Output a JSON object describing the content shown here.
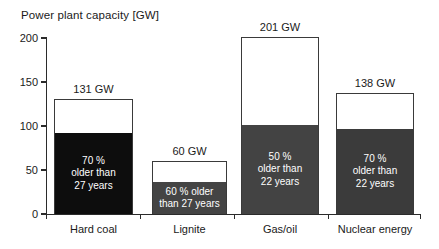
{
  "chart_data": {
    "type": "bar",
    "title": "Power plant capacity [GW]",
    "xlabel": "",
    "ylabel": "",
    "ylim": [
      0,
      200
    ],
    "yticks": [
      0,
      50,
      100,
      150,
      200
    ],
    "grid": false,
    "legend": "none",
    "unit": "GW",
    "categories": [
      "Hard coal",
      "Lignite",
      "Gas/oil",
      "Nuclear energy"
    ],
    "values": [
      131,
      60,
      201,
      138
    ],
    "value_labels": [
      "131 GW",
      "60 GW",
      "201 GW",
      "138 GW"
    ],
    "series": [
      {
        "name": "Total capacity",
        "values": [
          131,
          60,
          201,
          138
        ]
      },
      {
        "name": "Aged capacity (older than threshold)",
        "values": [
          92,
          36,
          101,
          97
        ],
        "share_percent": [
          70,
          60,
          50,
          70
        ],
        "age_years": [
          27,
          27,
          22,
          22
        ]
      }
    ],
    "bars": [
      {
        "category": "Hard coal",
        "total": 131,
        "total_label": "131 GW",
        "aged_value": 92,
        "aged_share_percent": 70,
        "aged_age_years": 27,
        "inner_label_lines": [
          "70 %",
          "older than",
          "27 years"
        ],
        "fill_color": "#0d0d0d",
        "outline_color": "#3a3a3a"
      },
      {
        "category": "Lignite",
        "total": 60,
        "total_label": "60 GW",
        "aged_value": 36,
        "aged_share_percent": 60,
        "aged_age_years": 27,
        "inner_label_lines": [
          "60 % older",
          "than 27 years"
        ],
        "fill_color": "#444444",
        "outline_color": "#3a3a3a"
      },
      {
        "category": "Gas/oil",
        "total": 201,
        "total_label": "201 GW",
        "aged_value": 101,
        "aged_share_percent": 50,
        "aged_age_years": 22,
        "inner_label_lines": [
          "50 %",
          "older than",
          "22 years"
        ],
        "fill_color": "#434343",
        "outline_color": "#3a3a3a"
      },
      {
        "category": "Nuclear energy",
        "total": 138,
        "total_label": "138 GW",
        "aged_value": 97,
        "aged_share_percent": 70,
        "aged_age_years": 22,
        "inner_label_lines": [
          "70 %",
          "older than",
          "22 years"
        ],
        "fill_color": "#3b3b3b",
        "outline_color": "#3a3a3a"
      }
    ]
  },
  "axis": {
    "y_tick_labels": [
      "0",
      "50",
      "100",
      "150",
      "200"
    ]
  }
}
